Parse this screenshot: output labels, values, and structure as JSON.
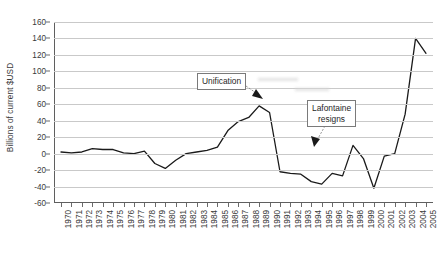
{
  "chart_data": {
    "type": "line",
    "title": "",
    "xlabel": "",
    "ylabel": "Billions of current $USD",
    "ylim": [
      -60,
      160
    ],
    "ytick_step": 20,
    "grid": true,
    "legend": "none",
    "line_color": "#1a1a1a",
    "x": [
      1970,
      1971,
      1972,
      1973,
      1974,
      1975,
      1976,
      1977,
      1978,
      1979,
      1980,
      1981,
      1982,
      1983,
      1984,
      1985,
      1986,
      1987,
      1988,
      1989,
      1990,
      1991,
      1992,
      1993,
      1994,
      1995,
      1996,
      1997,
      1998,
      1999,
      2000,
      2001,
      2002,
      2003,
      2004,
      2005
    ],
    "xticklabels": [
      "1970",
      "1971",
      "1972",
      "1973",
      "1974",
      "1975",
      "1976",
      "1977",
      "1978",
      "1979",
      "1980",
      "1981",
      "1982",
      "1983",
      "1984",
      "1985",
      "1986",
      "1987",
      "1988",
      "1989",
      "1990",
      "1991",
      "1992",
      "1993",
      "1994",
      "1995",
      "1996",
      "1997",
      "1998",
      "1999",
      "2000",
      "2001",
      "2002",
      "2003",
      "2004",
      "2005"
    ],
    "yticklabels": [
      "160",
      "140",
      "120",
      "100",
      "80",
      "60",
      "40",
      "20",
      "0",
      "-20",
      "-40",
      "-60"
    ],
    "yticks": [
      160,
      140,
      120,
      100,
      80,
      60,
      40,
      20,
      0,
      -20,
      -40,
      -60
    ],
    "series": [
      {
        "name": "Current account balance",
        "values": [
          2,
          1,
          2,
          6,
          5,
          5,
          1,
          0,
          3,
          -12,
          -18,
          -8,
          0,
          2,
          4,
          8,
          28,
          39,
          44,
          58,
          50,
          -22,
          -24,
          -25,
          -34,
          -37,
          -24,
          -27,
          10,
          -6,
          -42,
          -3,
          0,
          48,
          140,
          122
        ]
      }
    ],
    "annotations": [
      {
        "label": "Unification",
        "target_x": 1990,
        "target_y": 52
      },
      {
        "label_line1": "Lafontaine",
        "label_line2": "resigns",
        "target_x": 1998,
        "target_y": 10
      }
    ]
  }
}
